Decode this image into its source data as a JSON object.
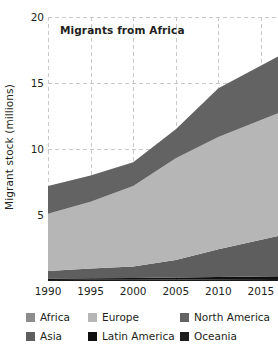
{
  "chart_data": {
    "type": "area",
    "title": "Migrants from Africa",
    "xlabel": "",
    "ylabel": "Migrant stock (millions)",
    "stacked": true,
    "grid": true,
    "legend_position": "bottom",
    "xlim": [
      1990,
      2017
    ],
    "ylim": [
      0,
      20
    ],
    "yticks": [
      5,
      10,
      15,
      20
    ],
    "ytick_labels": [
      "5",
      "10",
      "15",
      "20"
    ],
    "xticks": [
      1990,
      1995,
      2000,
      2005,
      2010,
      2015
    ],
    "xtick_labels": [
      "1990",
      "1995",
      "2000",
      "2005",
      "2010",
      "2015"
    ],
    "x": [
      1990,
      1995,
      2000,
      2005,
      2010,
      2017
    ],
    "series": [
      {
        "name": "Oceania",
        "color": "#1b1b1b",
        "values": [
          0.08,
          0.09,
          0.1,
          0.12,
          0.14,
          0.16
        ]
      },
      {
        "name": "Latin America",
        "color": "#101010",
        "values": [
          0.1,
          0.11,
          0.12,
          0.14,
          0.16,
          0.2
        ]
      },
      {
        "name": "Asia",
        "color": "#5e5e5e",
        "values": [
          0.57,
          0.75,
          0.88,
          1.34,
          2.1,
          3.04
        ]
      },
      {
        "name": "Europe",
        "color": "#b6b6b6",
        "values": [
          4.35,
          5.05,
          6.1,
          7.7,
          8.5,
          9.3
        ]
      },
      {
        "name": "North America",
        "color": "#636363",
        "values": [
          2.1,
          2.0,
          1.8,
          2.2,
          3.7,
          4.3
        ]
      }
    ],
    "totals": [
      7.2,
      8.0,
      9.0,
      11.5,
      14.6,
      17.0
    ]
  },
  "legend": {
    "items": [
      {
        "label": "Africa",
        "color": "#8c8c8c"
      },
      {
        "label": "Europe",
        "color": "#b6b6b6"
      },
      {
        "label": "North America",
        "color": "#636363"
      },
      {
        "label": "Asia",
        "color": "#5e5e5e"
      },
      {
        "label": "Latin America",
        "color": "#101010"
      },
      {
        "label": "Oceania",
        "color": "#1b1b1b"
      }
    ]
  },
  "style": {
    "grid_color": "#c9c9c9",
    "text_color": "#231f20",
    "background": "#ffffff"
  }
}
